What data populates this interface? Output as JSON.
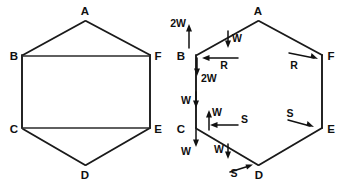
{
  "figure": {
    "panels": [
      {
        "id": "left",
        "name": "hexagonal-frame",
        "caption": "",
        "vertices": [
          {
            "label": "A",
            "x": 85,
            "y": 20
          },
          {
            "label": "B",
            "x": 22,
            "y": 55
          },
          {
            "label": "C",
            "x": 22,
            "y": 128
          },
          {
            "label": "D",
            "x": 85,
            "y": 166
          },
          {
            "label": "E",
            "x": 150,
            "y": 128
          },
          {
            "label": "F",
            "x": 150,
            "y": 55
          }
        ],
        "members": [
          "A-B",
          "B-C",
          "C-D",
          "D-E",
          "E-F",
          "F-A",
          "B-F",
          "C-E"
        ]
      },
      {
        "id": "right",
        "name": "force-diagram",
        "caption": "",
        "vertices": [
          {
            "label": "A",
            "x": 258,
            "y": 20
          },
          {
            "label": "B",
            "x": 196,
            "y": 55
          },
          {
            "label": "C",
            "x": 196,
            "y": 128
          },
          {
            "label": "D",
            "x": 258,
            "y": 166
          },
          {
            "label": "E",
            "x": 322,
            "y": 128
          },
          {
            "label": "F",
            "x": 322,
            "y": 55
          }
        ],
        "members": [
          "A-B",
          "B-C",
          "C-D",
          "D-E",
          "E-F",
          "F-A"
        ],
        "forces": [
          {
            "label": "2W",
            "direction": "up",
            "at": "above-B",
            "x": 186,
            "y": 29
          },
          {
            "label": "W",
            "direction": "down",
            "at": "on-AB-member",
            "x": 232,
            "y": 38
          },
          {
            "label": "R",
            "direction": "left",
            "at": "right-of-B",
            "x": 226,
            "y": 64
          },
          {
            "label": "2W",
            "direction": "down",
            "at": "below-B",
            "x": 196,
            "y": 80
          },
          {
            "label": "R",
            "direction": "right",
            "at": "left-of-F",
            "x": 296,
            "y": 64
          },
          {
            "label": "W",
            "direction": "down",
            "at": "on-BC-member",
            "x": 182,
            "y": 104
          },
          {
            "label": "W",
            "direction": "up",
            "at": "above-C-right",
            "x": 213,
            "y": 117
          },
          {
            "label": "S",
            "direction": "left",
            "at": "right-of-C",
            "x": 226,
            "y": 127
          },
          {
            "label": "W",
            "direction": "down",
            "at": "below-C",
            "x": 186,
            "y": 151
          },
          {
            "label": "S",
            "direction": "right",
            "at": "left-of-E",
            "x": 296,
            "y": 124
          },
          {
            "label": "W",
            "direction": "down",
            "at": "on-CD-member",
            "x": 221,
            "y": 152
          },
          {
            "label": "S",
            "direction": "up-right",
            "at": "left-of-D",
            "x": 237,
            "y": 171
          }
        ]
      }
    ],
    "legend_symbols": {
      "W": "W",
      "double_W": "2W",
      "R": "R",
      "S": "S"
    },
    "colors": {
      "line": "#1a1a1a",
      "text": "#101010",
      "background": "#ffffff"
    }
  }
}
